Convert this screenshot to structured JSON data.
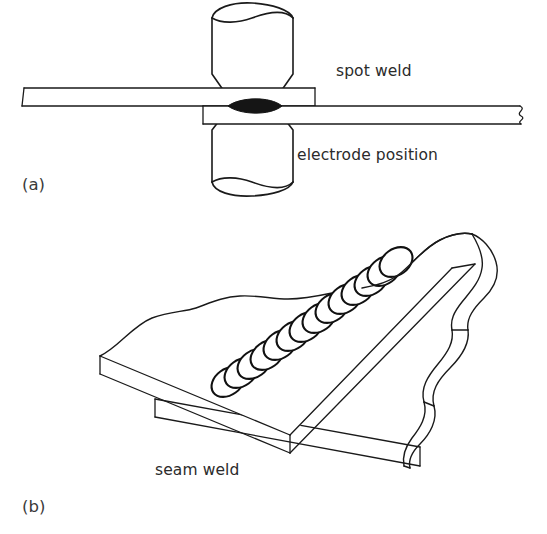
{
  "figure": {
    "background_color": "#ffffff",
    "line_color": "#1a1a1a",
    "nugget_color": "#151515"
  },
  "panels": [
    {
      "id": "a",
      "label": "(a)",
      "subject": "spot weld",
      "annotations": [
        {
          "name": "spot-weld-label",
          "text": "spot weld",
          "x": 336,
          "y": 76
        },
        {
          "name": "electrode-position-label",
          "text": "electrode position",
          "x": 297,
          "y": 160
        }
      ],
      "parts": [
        {
          "name": "upper-electrode",
          "icon": "electrode-icon"
        },
        {
          "name": "lower-electrode",
          "icon": "electrode-icon"
        },
        {
          "name": "upper-sheet",
          "icon": "sheet-metal-icon"
        },
        {
          "name": "lower-sheet",
          "icon": "sheet-metal-icon"
        },
        {
          "name": "weld-nugget",
          "icon": "weld-nugget-icon"
        }
      ]
    },
    {
      "id": "b",
      "label": "(b)",
      "subject": "seam weld",
      "annotations": [
        {
          "name": "seam-weld-label",
          "text": "seam weld",
          "x": 155,
          "y": 475
        }
      ],
      "parts": [
        {
          "name": "upper-sheet-isometric",
          "icon": "sheet-metal-icon"
        },
        {
          "name": "lower-sheet-isometric",
          "icon": "sheet-metal-icon"
        },
        {
          "name": "torn-edge",
          "icon": "torn-edge-icon"
        },
        {
          "name": "seam-weld-nugget-chain",
          "icon": "weld-nugget-chain-icon",
          "nugget_count": 14
        }
      ]
    }
  ],
  "seam_nuggets": {
    "count": 14,
    "rx": 18,
    "ry": 13,
    "rotation_deg": -36,
    "start": {
      "x": 228,
      "y": 382
    },
    "end": {
      "x": 395,
      "y": 262
    }
  }
}
